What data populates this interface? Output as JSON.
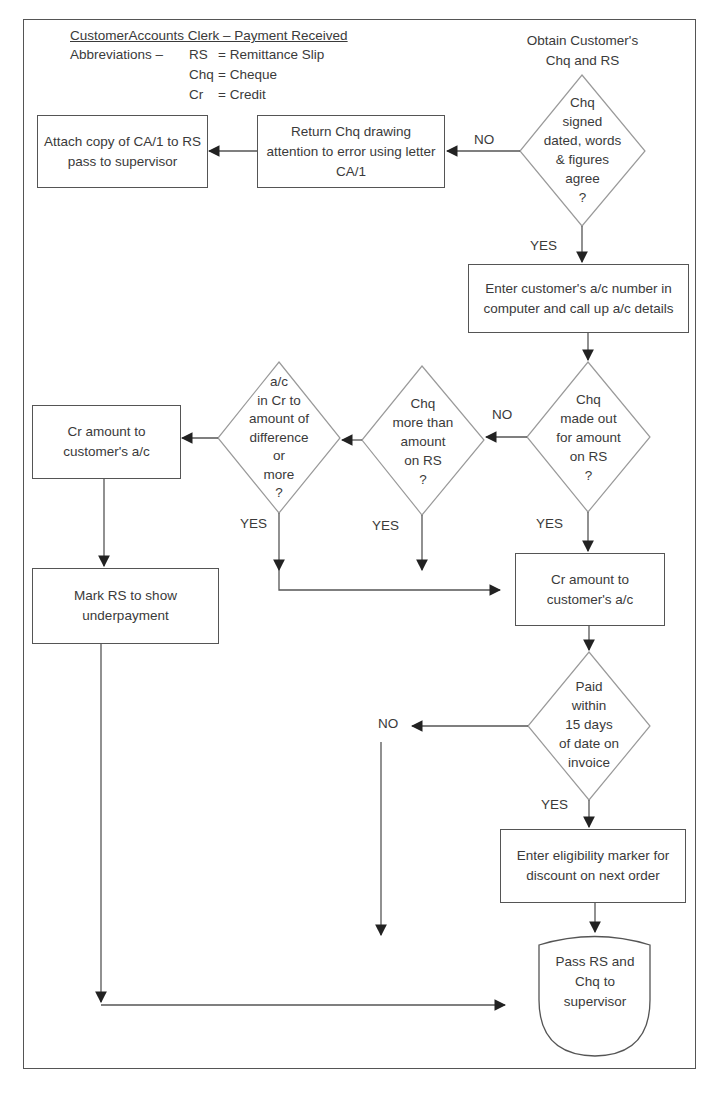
{
  "header": {
    "title": "CustomerAccounts Clerk – Payment Received",
    "abbreviations_label": "Abbreviations –",
    "abbreviations": [
      {
        "abbr": "RS",
        "meaning": "= Remittance Slip"
      },
      {
        "abbr": "Chq",
        "meaning": "= Cheque"
      },
      {
        "abbr": "Cr",
        "meaning": "= Credit"
      }
    ]
  },
  "start": {
    "label": "Obtain Customer's\nChq and RS"
  },
  "nodes": {
    "decision_cheque_valid": "Chq\nsigned\ndated, words\n& figures\nagree\n?",
    "return_cheque": "Return Chq drawing attention to error using letter CA/1",
    "attach_copy": "Attach copy of CA/1 to RS pass to supervisor",
    "enter_account": "Enter customer's a/c number in computer and call up a/c details",
    "decision_amount_match": "Chq\nmade out\nfor amount\non RS\n?",
    "decision_more_than": "Chq\nmore than\namount\non RS\n?",
    "decision_in_credit": "a/c\nin Cr to\namount of\ndifference\nor\nmore\n?",
    "credit_left": "Cr amount to customer's a/c",
    "mark_underpayment": "Mark RS to show underpayment",
    "credit_right": "Cr amount to customer's a/c",
    "decision_paid_15_days": "Paid\nwithin\n15 days\nof date on\ninvoice",
    "enter_eligibility": "Enter eligibility marker for discount on next order",
    "terminal_pass": "Pass RS and Chq to supervisor"
  },
  "labels": {
    "no_1": "NO",
    "yes_1": "YES",
    "no_2": "NO",
    "yes_2": "YES",
    "yes_3": "YES",
    "yes_4": "YES",
    "no_3": "NO",
    "yes_5": "YES"
  },
  "colors": {
    "line": "#555555",
    "diamond": "#9a9a9a",
    "text": "#3a3a3a"
  }
}
